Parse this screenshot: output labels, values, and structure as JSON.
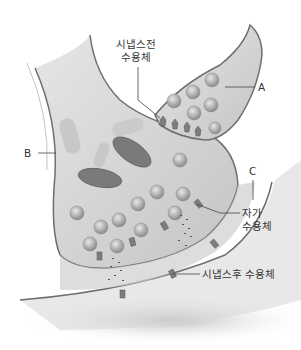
{
  "labels": {
    "presynaptic_receptor": [
      "시냅스전",
      "수용체"
    ],
    "A": "A",
    "B": "B",
    "C": "C",
    "autoreceptor": [
      "자가",
      "수용체"
    ],
    "postsynaptic_receptor": "시냅스후 수용체"
  },
  "colors": {
    "membrane": "#6e6e6e",
    "cytoplasm": "#d4d4d4",
    "cleft": "#c4c4c4",
    "vesicle": "#a8a8a8",
    "mitochondria": "#7a7a7a",
    "receptor": "#7d7d7d",
    "label_text": "#333333",
    "leader_line": "#444444"
  }
}
